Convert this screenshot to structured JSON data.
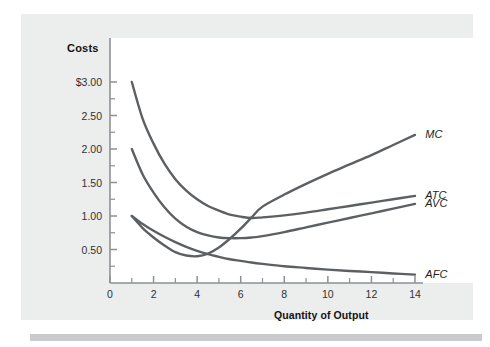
{
  "figure": {
    "background_color": "#ffffff",
    "panel_color": "#eceded",
    "plot_color": "#ffffff",
    "bottom_bar_color": "#c8cacb",
    "axis_color": "#8d9193",
    "curve_color": "#5d6063"
  },
  "chart_data": {
    "type": "line",
    "title": "",
    "ylabel": "Costs",
    "xlabel": "Quantity of Output",
    "xlim": [
      0,
      14.6
    ],
    "ylim": [
      0,
      3.25
    ],
    "grid": false,
    "legend_position": "right-inline-labels",
    "x_ticks_major": [
      0,
      2,
      4,
      6,
      8,
      10,
      12,
      14
    ],
    "x_tick_labels": [
      "0",
      "2",
      "4",
      "6",
      "8",
      "10",
      "12",
      "14"
    ],
    "x_ticks_minor": [
      1,
      3,
      5,
      7,
      9,
      11,
      13
    ],
    "y_ticks_major": [
      0.5,
      1.0,
      1.5,
      2.0,
      2.5,
      3.0
    ],
    "y_tick_labels": [
      "0.50",
      "1.00",
      "1.50",
      "2.00",
      "2.50",
      "$3.00"
    ],
    "y_ticks_minor": [
      0.25,
      0.75,
      1.25,
      1.75,
      2.25,
      2.75
    ],
    "series": [
      {
        "name": "MC",
        "label": "MC",
        "description": "Marginal cost curve",
        "x": [
          1,
          1.5,
          2,
          2.5,
          3,
          3.5,
          4,
          4.5,
          5,
          5.5,
          6,
          6.5,
          7,
          8,
          9,
          10,
          11,
          12,
          13,
          14
        ],
        "values": [
          1.0,
          0.82,
          0.68,
          0.56,
          0.46,
          0.41,
          0.4,
          0.44,
          0.53,
          0.66,
          0.81,
          0.98,
          1.14,
          1.32,
          1.48,
          1.63,
          1.77,
          1.91,
          2.06,
          2.21
        ]
      },
      {
        "name": "ATC",
        "label": "ATC",
        "description": "Average total cost curve",
        "x": [
          1,
          1.5,
          2,
          2.5,
          3,
          3.5,
          4,
          4.5,
          5,
          5.5,
          6,
          6.5,
          7,
          8,
          9,
          10,
          11,
          12,
          13,
          14
        ],
        "values": [
          3.0,
          2.45,
          2.08,
          1.78,
          1.55,
          1.38,
          1.25,
          1.15,
          1.08,
          1.02,
          0.99,
          0.97,
          0.98,
          1.01,
          1.05,
          1.1,
          1.15,
          1.2,
          1.25,
          1.3
        ]
      },
      {
        "name": "AVC",
        "label": "AVC",
        "description": "Average variable cost curve",
        "x": [
          1,
          1.5,
          2,
          2.5,
          3,
          3.5,
          4,
          4.5,
          5,
          5.5,
          6,
          6.5,
          7,
          8,
          9,
          10,
          11,
          12,
          13,
          14
        ],
        "values": [
          2.0,
          1.62,
          1.35,
          1.13,
          0.96,
          0.84,
          0.76,
          0.71,
          0.68,
          0.67,
          0.67,
          0.68,
          0.7,
          0.76,
          0.83,
          0.9,
          0.97,
          1.04,
          1.11,
          1.18
        ]
      },
      {
        "name": "AFC",
        "label": "AFC",
        "description": "Average fixed cost curve",
        "x": [
          1,
          1.5,
          2,
          2.5,
          3,
          3.5,
          4,
          4.5,
          5,
          5.5,
          6,
          6.5,
          7,
          8,
          9,
          10,
          11,
          12,
          13,
          14
        ],
        "values": [
          1.0,
          0.88,
          0.78,
          0.69,
          0.61,
          0.54,
          0.48,
          0.43,
          0.39,
          0.355,
          0.33,
          0.305,
          0.285,
          0.25,
          0.225,
          0.2,
          0.18,
          0.162,
          0.142,
          0.125
        ]
      }
    ],
    "curve_labels": [
      {
        "text": "MC",
        "at_x": 14.2,
        "at_y": 2.21
      },
      {
        "text": "ATC",
        "at_x": 14.2,
        "at_y": 1.3
      },
      {
        "text": "AVC",
        "at_x": 14.2,
        "at_y": 1.18
      },
      {
        "text": "AFC",
        "at_x": 14.2,
        "at_y": 0.125
      }
    ]
  }
}
